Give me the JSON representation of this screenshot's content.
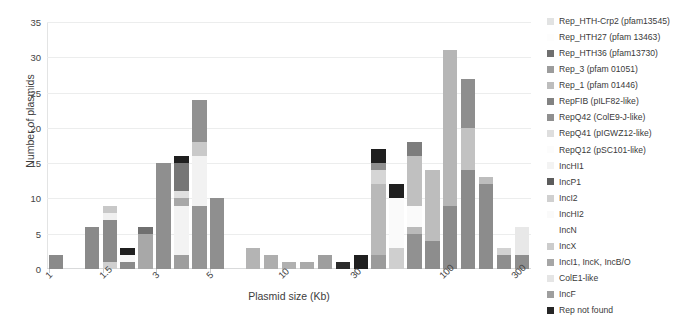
{
  "chart_data": {
    "type": "bar",
    "title": "",
    "stacked": true,
    "xlabel": "Plasmid size (Kb)",
    "ylabel": "Number of plasmids",
    "ylim": [
      0,
      35
    ],
    "yticks": [
      0,
      5,
      10,
      15,
      20,
      25,
      30,
      35
    ],
    "grid": true,
    "legend_position": "right",
    "xtick_labels": [
      "1",
      "1.5",
      "3",
      "5",
      "10",
      "30",
      "100",
      "300"
    ],
    "xtick_bin_index": [
      0,
      3,
      6,
      9,
      13,
      17,
      22,
      26
    ],
    "categories": [
      "bin1",
      "bin2",
      "bin3",
      "bin4",
      "bin5",
      "bin6",
      "bin7",
      "bin8",
      "bin9",
      "bin10",
      "bin11",
      "bin12",
      "bin13",
      "bin14",
      "bin15",
      "bin16",
      "bin17",
      "bin18",
      "bin19",
      "bin20",
      "bin21",
      "bin22",
      "bin23",
      "bin24",
      "bin25",
      "bin26",
      "bin27"
    ],
    "series": [
      {
        "name": "Rep_HTH-Crp2 (pfam13545)",
        "color": "#e8e9e9",
        "values": [
          0,
          0,
          0.8,
          0,
          0,
          0,
          0,
          0,
          0,
          0,
          0,
          0,
          0,
          0,
          0,
          0,
          0,
          0,
          0,
          0,
          0,
          0,
          0,
          0,
          0,
          0,
          0
        ]
      },
      {
        "name": "Rep_HTH27 (pfam 13463)",
        "color": "#fbfbfb",
        "values": [
          0,
          0.8,
          0,
          0,
          0,
          0,
          0,
          0,
          0,
          0,
          0,
          0,
          0,
          0,
          0,
          0,
          0,
          0,
          0,
          0,
          0,
          0,
          0,
          0,
          0,
          0,
          0
        ]
      },
      {
        "name": "Rep_HTH36 (pfam13730)",
        "color": "#6e6e6e",
        "values": [
          0,
          0,
          0,
          0,
          0,
          0,
          0,
          0,
          0,
          0,
          0,
          0,
          0,
          0,
          0,
          0,
          0,
          0,
          0,
          0,
          0,
          0,
          0,
          0,
          0,
          0,
          0
        ]
      },
      {
        "name": "Rep_3 (pfam 01051)",
        "color": "#9a9a9a",
        "values": [
          0,
          0,
          0,
          0,
          0,
          0,
          0,
          0,
          0,
          0,
          0,
          0,
          0,
          0,
          0,
          0,
          0,
          0,
          0,
          0,
          0,
          0,
          0,
          0,
          0,
          0,
          0
        ]
      },
      {
        "name": "Rep_1 (pfam 01446)",
        "color": "#bcbcbc",
        "values": [
          0,
          0,
          0,
          0,
          0,
          0,
          0,
          0,
          0,
          0,
          0,
          0,
          0,
          0,
          0,
          0,
          0,
          0,
          0,
          0,
          0,
          0,
          0,
          0,
          0,
          0,
          0
        ]
      },
      {
        "name": "RepFIB (pILF82-like)",
        "color": "#808080",
        "values": [
          0,
          0,
          0,
          0,
          0,
          0,
          0,
          0,
          0,
          0,
          0,
          0,
          0,
          0,
          0,
          0,
          0,
          0,
          0,
          0,
          0,
          0,
          0,
          0,
          0,
          0,
          0
        ]
      },
      {
        "name": "RepQ42 (ColE9-J-like)",
        "color": "#8d8d8d",
        "values": [
          0,
          0,
          0,
          0,
          0,
          0,
          0,
          0,
          0,
          0,
          0,
          0,
          0,
          0,
          0,
          0,
          0,
          0,
          0,
          0,
          0,
          0,
          0,
          0,
          0,
          0,
          0
        ]
      },
      {
        "name": "RepQ41 (pIGWZ12-like)",
        "color": "#dddddd",
        "values": [
          0,
          0,
          0,
          0,
          0,
          0,
          0,
          0,
          0,
          0,
          0,
          0,
          0,
          0,
          0,
          0,
          0,
          0,
          0,
          0,
          0,
          0,
          0,
          0,
          0,
          0,
          0
        ]
      },
      {
        "name": "RepQ12 (pSC101-like)",
        "color": "#fcfcfc",
        "values": [
          0,
          0,
          0,
          0,
          0,
          0,
          0,
          0,
          0,
          0,
          0,
          0,
          0,
          0,
          0,
          0,
          0,
          0,
          0,
          0,
          0,
          0,
          0,
          0,
          0,
          0,
          0
        ]
      },
      {
        "name": "IncHI1",
        "color": "#f2f2f2",
        "values": [
          0,
          0,
          0,
          0,
          0,
          0,
          0,
          0,
          0,
          0,
          0,
          0,
          0,
          0,
          0,
          0,
          0,
          0,
          0,
          0,
          0,
          0,
          0,
          0,
          0,
          0,
          0
        ]
      },
      {
        "name": "IncP1",
        "color": "#5a5a5a",
        "values": [
          0,
          0,
          0,
          0,
          0,
          0,
          0,
          0,
          0,
          0,
          0,
          0,
          0,
          0,
          0,
          0,
          0,
          0,
          0,
          0,
          0,
          0,
          0,
          0,
          0,
          0,
          0
        ]
      },
      {
        "name": "IncI2",
        "color": "#cfcfcf",
        "values": [
          0,
          0,
          0,
          0,
          0,
          0,
          0,
          0,
          0,
          0,
          0,
          0,
          0,
          0,
          0,
          0,
          0,
          0,
          0,
          0,
          0,
          0,
          0,
          0,
          0,
          0,
          0
        ]
      },
      {
        "name": "IncHI2",
        "color": "#fafafa",
        "values": [
          0,
          0,
          0,
          0,
          0,
          0,
          0,
          0,
          0,
          0,
          0,
          0,
          0,
          0,
          0,
          0,
          0,
          0,
          0,
          0,
          0,
          0,
          0,
          0,
          0,
          0,
          0
        ]
      },
      {
        "name": "IncN",
        "color": "#ffffff",
        "values": [
          0,
          0,
          0,
          0,
          0,
          0,
          0,
          0,
          0,
          0,
          0,
          0,
          0,
          0,
          0,
          0,
          0,
          0,
          0,
          0,
          0,
          0,
          0,
          0,
          0,
          0,
          0
        ]
      },
      {
        "name": "IncX",
        "color": "#cbcbcb",
        "values": [
          0,
          0,
          0,
          0,
          0,
          0,
          0,
          0,
          0,
          0,
          0,
          0,
          0,
          0,
          0,
          0,
          0,
          0,
          0,
          0,
          0,
          0,
          0,
          0,
          0,
          0,
          0
        ]
      },
      {
        "name": "IncI1, IncK, IncB/O",
        "color": "#a5a5a5",
        "values": [
          0,
          0,
          0,
          0,
          0,
          0,
          0,
          0,
          0,
          0,
          0,
          0,
          0,
          0,
          0,
          0,
          0,
          0,
          0,
          0,
          0,
          0,
          0,
          0,
          0,
          0,
          0
        ]
      },
      {
        "name": "ColE1-like",
        "color": "#e4e4e4",
        "values": [
          0,
          0,
          0,
          0,
          0,
          0,
          0,
          0,
          0,
          0,
          0,
          0,
          0,
          0,
          0,
          0,
          0,
          0,
          0,
          0,
          0,
          0,
          0,
          0,
          0,
          0,
          0
        ]
      },
      {
        "name": "IncF",
        "color": "#9d9d9d",
        "values": [
          0,
          0,
          0,
          0,
          0,
          0,
          0,
          0,
          0,
          0,
          0,
          0,
          0,
          0,
          0,
          0,
          0,
          0,
          0,
          0,
          0,
          0,
          0,
          0,
          0,
          0,
          0
        ]
      },
      {
        "name": "Rep not found",
        "color": "#262626",
        "values": [
          0,
          0,
          0,
          0,
          0,
          0,
          0,
          0,
          0,
          0,
          0,
          0,
          0,
          0,
          0,
          0,
          0,
          0,
          0,
          0,
          0,
          0,
          0,
          0,
          0,
          0,
          0
        ]
      }
    ],
    "bars": [
      {
        "x": "bin1",
        "total": 2,
        "segments": [
          {
            "color": "#8a8a8a",
            "value": 2
          }
        ]
      },
      {
        "x": "bin2",
        "total": 0,
        "segments": []
      },
      {
        "x": "bin3",
        "total": 6,
        "segments": [
          {
            "color": "#8a8a8a",
            "value": 6
          }
        ]
      },
      {
        "x": "bin4",
        "total": 9,
        "segments": [
          {
            "color": "#d0d0d0",
            "value": 1
          },
          {
            "color": "#8a8a8a",
            "value": 6
          },
          {
            "color": "#f0f0f0",
            "value": 1
          },
          {
            "color": "#c8c8c8",
            "value": 1
          }
        ]
      },
      {
        "x": "bin5",
        "total": 3,
        "segments": [
          {
            "color": "#8a8a8a",
            "value": 1
          },
          {
            "color": "#f7f7f7",
            "value": 1
          },
          {
            "color": "#1f1f1f",
            "value": 1
          }
        ]
      },
      {
        "x": "bin6",
        "total": 6,
        "segments": [
          {
            "color": "#a8a8a8",
            "value": 5
          },
          {
            "color": "#707070",
            "value": 1
          }
        ]
      },
      {
        "x": "bin7",
        "total": 15,
        "segments": [
          {
            "color": "#8f8f8f",
            "value": 15
          }
        ]
      },
      {
        "x": "bin8",
        "total": 16,
        "segments": [
          {
            "color": "#9e9e9e",
            "value": 2
          },
          {
            "color": "#f3f3f3",
            "value": 7
          },
          {
            "color": "#a8a8a8",
            "value": 1
          },
          {
            "color": "#e0e0e0",
            "value": 1
          },
          {
            "color": "#767676",
            "value": 4
          },
          {
            "color": "#1f1f1f",
            "value": 1
          }
        ]
      },
      {
        "x": "bin9",
        "total": 24,
        "segments": [
          {
            "color": "#959595",
            "value": 9
          },
          {
            "color": "#f2f2f2",
            "value": 7
          },
          {
            "color": "#c9c9c9",
            "value": 2
          },
          {
            "color": "#919191",
            "value": 6
          }
        ]
      },
      {
        "x": "bin10",
        "total": 10,
        "segments": [
          {
            "color": "#8f8f8f",
            "value": 10
          }
        ]
      },
      {
        "x": "bin11",
        "total": 0,
        "segments": []
      },
      {
        "x": "bin12",
        "total": 3,
        "segments": [
          {
            "color": "#b4b4b4",
            "value": 3
          }
        ]
      },
      {
        "x": "bin13",
        "total": 2,
        "segments": [
          {
            "color": "#aeaeae",
            "value": 2
          }
        ]
      },
      {
        "x": "bin14",
        "total": 1,
        "segments": [
          {
            "color": "#b0b0b0",
            "value": 1
          }
        ]
      },
      {
        "x": "bin15",
        "total": 1,
        "segments": [
          {
            "color": "#aaaaaa",
            "value": 1
          }
        ]
      },
      {
        "x": "bin16",
        "total": 2,
        "segments": [
          {
            "color": "#9e9e9e",
            "value": 2
          }
        ]
      },
      {
        "x": "bin17",
        "total": 1,
        "segments": [
          {
            "color": "#2a2a2a",
            "value": 1
          }
        ]
      },
      {
        "x": "bin18",
        "total": 2,
        "segments": [
          {
            "color": "#1f1f1f",
            "value": 2
          }
        ]
      },
      {
        "x": "bin19",
        "total": 17,
        "segments": [
          {
            "color": "#9b9b9b",
            "value": 2
          },
          {
            "color": "#b9b9b9",
            "value": 10
          },
          {
            "color": "#d5d5d5",
            "value": 2
          },
          {
            "color": "#8f8f8f",
            "value": 1
          },
          {
            "color": "#1f1f1f",
            "value": 2
          }
        ]
      },
      {
        "x": "bin20",
        "total": 12,
        "segments": [
          {
            "color": "#cfcfcf",
            "value": 3
          },
          {
            "color": "#fafafa",
            "value": 7
          },
          {
            "color": "#1f1f1f",
            "value": 2
          }
        ]
      },
      {
        "x": "bin21",
        "total": 18,
        "segments": [
          {
            "color": "#919191",
            "value": 5
          },
          {
            "color": "#bababa",
            "value": 1
          },
          {
            "color": "#fafafa",
            "value": 3
          },
          {
            "color": "#c0c0c0",
            "value": 7
          },
          {
            "color": "#7d7d7d",
            "value": 2
          }
        ]
      },
      {
        "x": "bin22",
        "total": 14,
        "segments": [
          {
            "color": "#8d8d8d",
            "value": 4
          },
          {
            "color": "#bdbdbd",
            "value": 10
          }
        ]
      },
      {
        "x": "bin23",
        "total": 31,
        "segments": [
          {
            "color": "#8b8b8b",
            "value": 9
          },
          {
            "color": "#b6b6b6",
            "value": 22
          }
        ]
      },
      {
        "x": "bin24",
        "total": 27,
        "segments": [
          {
            "color": "#8b8b8b",
            "value": 14
          },
          {
            "color": "#c2c2c2",
            "value": 6
          },
          {
            "color": "#8e8e8e",
            "value": 7
          }
        ]
      },
      {
        "x": "bin25",
        "total": 13,
        "segments": [
          {
            "color": "#8c8c8c",
            "value": 12
          },
          {
            "color": "#bdbdbd",
            "value": 1
          }
        ]
      },
      {
        "x": "bin26",
        "total": 3,
        "segments": [
          {
            "color": "#8e8e8e",
            "value": 2
          },
          {
            "color": "#d2d2d2",
            "value": 1
          }
        ]
      },
      {
        "x": "bin27",
        "total": 6,
        "segments": [
          {
            "color": "#8e8e8e",
            "value": 2
          },
          {
            "color": "#e8e8e8",
            "value": 4
          }
        ]
      }
    ]
  },
  "legend": {
    "items": [
      {
        "label": "Rep_HTH-Crp2 (pfam13545)",
        "color": "#e2e3e3"
      },
      {
        "label": "Rep_HTH27 (pfam 13463)",
        "color": "#fdfdfd"
      },
      {
        "label": "Rep_HTH36 (pfam13730)",
        "color": "#6f6f6f"
      },
      {
        "label": "Rep_3 (pfam 01051)",
        "color": "#9c9c9c"
      },
      {
        "label": "Rep_1 (pfam 01446)",
        "color": "#bdbdbd"
      },
      {
        "label": "RepFIB (pILF82-like)",
        "color": "#828282"
      },
      {
        "label": "RepQ42 (ColE9-J-like)",
        "color": "#8f8f8f"
      },
      {
        "label": "RepQ41 (pIGWZ12-like)",
        "color": "#dedede"
      },
      {
        "label": "RepQ12 (pSC101-like)",
        "color": "#fcfcfc"
      },
      {
        "label": "IncHI1",
        "color": "#f3f3f3"
      },
      {
        "label": "IncP1",
        "color": "#5c5c5c"
      },
      {
        "label": "IncI2",
        "color": "#d0d0d0"
      },
      {
        "label": "IncHI2",
        "color": "#fafafa"
      },
      {
        "label": "IncN",
        "color": "#ffffff"
      },
      {
        "label": "IncX",
        "color": "#cccccc"
      },
      {
        "label": "IncI1, IncK, IncB/O",
        "color": "#a6a6a6"
      },
      {
        "label": "ColE1-like",
        "color": "#e5e5e5"
      },
      {
        "label": "IncF",
        "color": "#9e9e9e"
      },
      {
        "label": "Rep not found",
        "color": "#262626"
      }
    ]
  }
}
